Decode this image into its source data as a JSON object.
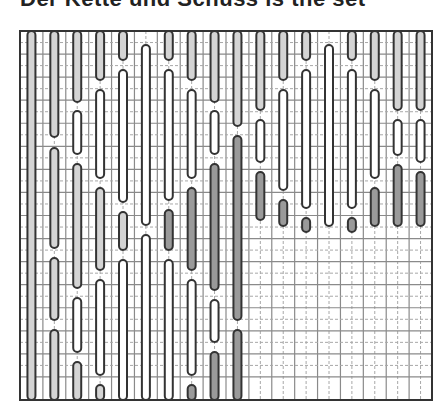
{
  "heading": "Der Kette und Schuss is the set",
  "diagram": {
    "type": "weaving-draft",
    "frame": {
      "x": 20,
      "y": 31,
      "w": 412,
      "h": 369
    },
    "cols": 18,
    "rows": 16,
    "colors": {
      "line": "#333333",
      "grid_solid": "#8a8a8a",
      "grid_dashed": "#a8a8a8",
      "fill_light": "#d4d4d4",
      "fill_dark": "#9a9a9a",
      "fill_white": "#ffffff"
    },
    "bars": [
      {
        "col": 0,
        "segments": [
          [
            31,
            400,
            "light"
          ]
        ]
      },
      {
        "col": 1,
        "segments": [
          [
            31,
            137,
            "light"
          ],
          [
            148,
            248,
            "light"
          ],
          [
            258,
            320,
            "light"
          ],
          [
            330,
            400,
            "light"
          ]
        ]
      },
      {
        "col": 2,
        "segments": [
          [
            31,
            102,
            "light"
          ],
          [
            111,
            154,
            "white"
          ],
          [
            164,
            288,
            "light"
          ],
          [
            298,
            352,
            "white"
          ],
          [
            362,
            400,
            "light"
          ]
        ]
      },
      {
        "col": 3,
        "segments": [
          [
            31,
            80,
            "light"
          ],
          [
            90,
            178,
            "white"
          ],
          [
            188,
            270,
            "light"
          ],
          [
            280,
            375,
            "white"
          ],
          [
            385,
            400,
            "light"
          ]
        ]
      },
      {
        "col": 4,
        "segments": [
          [
            31,
            60,
            "light"
          ],
          [
            70,
            202,
            "white"
          ],
          [
            212,
            250,
            "light"
          ],
          [
            260,
            400,
            "white"
          ]
        ]
      },
      {
        "col": 5,
        "segments": [
          [
            45,
            225,
            "white"
          ],
          [
            235,
            400,
            "white"
          ]
        ]
      },
      {
        "col": 6,
        "segments": [
          [
            31,
            60,
            "light"
          ],
          [
            70,
            200,
            "white"
          ],
          [
            210,
            250,
            "dark"
          ],
          [
            260,
            400,
            "white"
          ]
        ]
      },
      {
        "col": 7,
        "segments": [
          [
            31,
            80,
            "light"
          ],
          [
            90,
            178,
            "white"
          ],
          [
            188,
            270,
            "dark"
          ],
          [
            280,
            375,
            "white"
          ],
          [
            385,
            400,
            "dark"
          ]
        ]
      },
      {
        "col": 8,
        "segments": [
          [
            31,
            102,
            "light"
          ],
          [
            111,
            154,
            "white"
          ],
          [
            164,
            290,
            "dark"
          ],
          [
            300,
            342,
            "white"
          ],
          [
            352,
            400,
            "dark"
          ]
        ]
      },
      {
        "col": 9,
        "segments": [
          [
            31,
            126,
            "light"
          ],
          [
            136,
            320,
            "dark"
          ],
          [
            330,
            400,
            "dark"
          ]
        ]
      },
      {
        "col": 10,
        "segments": [
          [
            31,
            110,
            "light"
          ],
          [
            120,
            162,
            "white"
          ],
          [
            172,
            220,
            "dark"
          ]
        ]
      },
      {
        "col": 11,
        "segments": [
          [
            31,
            80,
            "light"
          ],
          [
            90,
            190,
            "white"
          ],
          [
            200,
            226,
            "dark"
          ]
        ]
      },
      {
        "col": 12,
        "segments": [
          [
            31,
            60,
            "light"
          ],
          [
            70,
            208,
            "white"
          ],
          [
            218,
            232,
            "dark"
          ]
        ]
      },
      {
        "col": 13,
        "segments": [
          [
            45,
            226,
            "white"
          ]
        ]
      },
      {
        "col": 14,
        "segments": [
          [
            31,
            60,
            "light"
          ],
          [
            70,
            208,
            "white"
          ],
          [
            218,
            232,
            "dark"
          ]
        ]
      },
      {
        "col": 15,
        "segments": [
          [
            31,
            80,
            "light"
          ],
          [
            90,
            178,
            "white"
          ],
          [
            188,
            226,
            "dark"
          ]
        ]
      },
      {
        "col": 16,
        "segments": [
          [
            31,
            110,
            "light"
          ],
          [
            120,
            155,
            "white"
          ],
          [
            165,
            226,
            "dark"
          ]
        ]
      },
      {
        "col": 17,
        "segments": [
          [
            31,
            110,
            "light"
          ],
          [
            120,
            162,
            "white"
          ],
          [
            172,
            226,
            "dark"
          ]
        ]
      }
    ]
  }
}
